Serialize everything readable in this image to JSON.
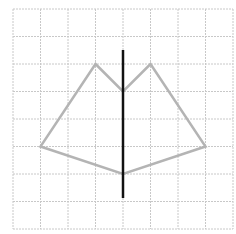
{
  "diagram": {
    "type": "grid-symmetry-figure",
    "grid": {
      "columns": 8,
      "rows": 8,
      "origin_x": 13,
      "origin_y": 9,
      "cell_size": 27.5,
      "line_color": "#c8c8c8"
    },
    "shape": {
      "stroke_color": "#b4b4b4",
      "vertices_grid": [
        [
          3,
          2
        ],
        [
          4,
          3
        ],
        [
          5,
          2
        ],
        [
          7,
          5
        ],
        [
          4,
          6
        ],
        [
          1,
          5
        ]
      ]
    },
    "axis": {
      "color": "#111111",
      "x_grid": 4,
      "y_start": 50,
      "y_end": 198
    }
  }
}
